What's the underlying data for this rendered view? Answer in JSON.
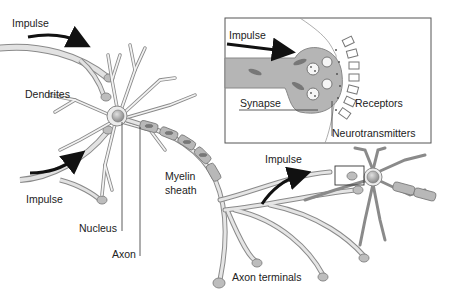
{
  "diagram": {
    "colors": {
      "membrane_fill": "#e8e8e8",
      "membrane_stroke": "#8a8a8a",
      "axon_terminal_fill": "#bdbdbd",
      "nucleus": "#9e9e9e",
      "myelin": "#b8b8b8",
      "arrow": "#111111",
      "inset_border": "#555555"
    },
    "labels": {
      "impulse_top": "Impulse",
      "dendrites": "Dendrites",
      "impulse_bottom": "Impulse",
      "nucleus": "Nucleus",
      "axon": "Axon",
      "myelin_sheath_line1": "Myelin",
      "myelin_sheath_line2": "sheath",
      "impulse_right": "Impulse",
      "axon_terminals": "Axon terminals"
    },
    "inset": {
      "title": "Synapse detail",
      "labels": {
        "impulse": "Impulse",
        "synapse": "Synapse",
        "receptors": "Receptors",
        "neurotransmitters": "Neurotransmitters"
      }
    }
  }
}
